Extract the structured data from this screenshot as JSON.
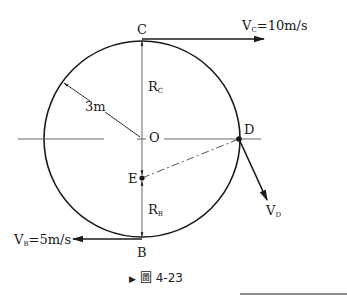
{
  "diagram": {
    "type": "circular-motion-free-body",
    "circle": {
      "center": "O",
      "radius_label": "3m"
    },
    "points": {
      "C": {
        "label": "C",
        "position": "top"
      },
      "B": {
        "label": "B",
        "position": "bottom"
      },
      "O": {
        "label": "O",
        "position": "center"
      },
      "D": {
        "label": "D",
        "position": "right, on horizontal diameter"
      },
      "E": {
        "label": "E",
        "position": "below center on vertical diameter"
      }
    },
    "velocities": {
      "vc": {
        "symbol": "V",
        "sub": "C",
        "rest": "=10m/s",
        "direction": "right"
      },
      "vb": {
        "symbol": "V",
        "sub": "B",
        "rest": "=5m/s",
        "direction": "left"
      },
      "vd": {
        "symbol": "V",
        "sub": "D",
        "direction": "down-right, tangent at D"
      }
    },
    "radii": {
      "rc": {
        "symbol": "R",
        "sub": "C"
      },
      "rb": {
        "symbol": "R",
        "sub": "B"
      }
    },
    "caption": {
      "marker": "▶",
      "text": "圖 4-23"
    }
  },
  "colors": {
    "stroke": "#1a1a1a",
    "thin": "#555555",
    "background": "#ffffff"
  }
}
